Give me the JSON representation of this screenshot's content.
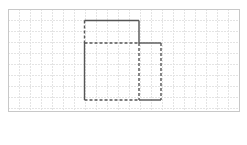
{
  "diagram": {
    "grid": {
      "origin_x": 8,
      "origin_y": 9,
      "cell": 11,
      "cols": 21,
      "width": 231,
      "height": 102,
      "line_color": "#e4e4e4",
      "border_color": "#c8c8c8"
    },
    "stroke_color": "#555555",
    "solid_segments": [
      [
        84.5,
        20.5,
        139,
        20.5
      ],
      [
        139,
        20.5,
        139,
        43
      ],
      [
        139,
        43,
        161,
        43
      ],
      [
        139,
        100,
        161,
        100
      ],
      [
        84.5,
        43,
        84.5,
        100
      ]
    ],
    "dashed_segments": [
      [
        84.5,
        20.5,
        84.5,
        43
      ],
      [
        84.5,
        43,
        139,
        43
      ],
      [
        139,
        43,
        139,
        100
      ],
      [
        161,
        43,
        161,
        100
      ],
      [
        84.5,
        100,
        139,
        100
      ]
    ]
  }
}
